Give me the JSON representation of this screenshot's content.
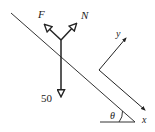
{
  "diagram": {
    "forces": {
      "friction_label": "F",
      "normal_label": "N",
      "weight_label": "50"
    },
    "axes": {
      "x_label": "x",
      "y_label": "y"
    },
    "angle_label": "θ",
    "colors": {
      "line": "#222222",
      "background": "#ffffff"
    }
  }
}
